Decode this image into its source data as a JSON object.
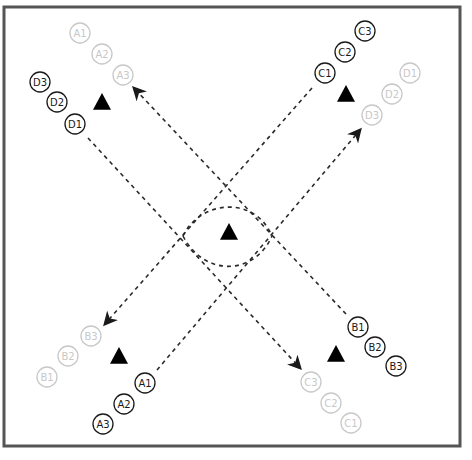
{
  "diagram": {
    "type": "drill-diagram",
    "field": {
      "x": 4,
      "y": 7,
      "width": 456,
      "height": 439,
      "border_color": "#555555",
      "border_width": 3
    },
    "colors": {
      "active": "#1a1a1a",
      "faded": "#c8c8c8",
      "line": "#2a2a2a",
      "cone": "#000000"
    },
    "players": [
      {
        "label": "A1",
        "x": 80,
        "y": 33,
        "style": "faded"
      },
      {
        "label": "A2",
        "x": 102,
        "y": 54,
        "style": "faded"
      },
      {
        "label": "A3",
        "x": 123,
        "y": 75,
        "style": "faded"
      },
      {
        "label": "D3",
        "x": 40,
        "y": 82,
        "style": "active"
      },
      {
        "label": "D2",
        "x": 57,
        "y": 102,
        "style": "active"
      },
      {
        "label": "D1",
        "x": 75,
        "y": 124,
        "style": "active"
      },
      {
        "label": "C3",
        "x": 365,
        "y": 31,
        "style": "active"
      },
      {
        "label": "C2",
        "x": 345,
        "y": 52,
        "style": "active"
      },
      {
        "label": "C1",
        "x": 325,
        "y": 73,
        "style": "active"
      },
      {
        "label": "D1",
        "x": 410,
        "y": 73,
        "style": "faded"
      },
      {
        "label": "D2",
        "x": 392,
        "y": 94,
        "style": "faded"
      },
      {
        "label": "D3",
        "x": 372,
        "y": 115,
        "style": "faded"
      },
      {
        "label": "B3",
        "x": 91,
        "y": 336,
        "style": "faded"
      },
      {
        "label": "B2",
        "x": 68,
        "y": 356,
        "style": "faded"
      },
      {
        "label": "B1",
        "x": 47,
        "y": 377,
        "style": "faded"
      },
      {
        "label": "A1",
        "x": 145,
        "y": 383,
        "style": "active"
      },
      {
        "label": "A2",
        "x": 124,
        "y": 404,
        "style": "active"
      },
      {
        "label": "A3",
        "x": 103,
        "y": 424,
        "style": "active"
      },
      {
        "label": "B1",
        "x": 358,
        "y": 327,
        "style": "active"
      },
      {
        "label": "B2",
        "x": 375,
        "y": 347,
        "style": "active"
      },
      {
        "label": "B3",
        "x": 396,
        "y": 366,
        "style": "active"
      },
      {
        "label": "C3",
        "x": 311,
        "y": 382,
        "style": "faded"
      },
      {
        "label": "C2",
        "x": 331,
        "y": 403,
        "style": "faded"
      },
      {
        "label": "C1",
        "x": 351,
        "y": 423,
        "style": "faded"
      }
    ],
    "cones": [
      {
        "name": "cone-top-left",
        "x": 102,
        "y": 102
      },
      {
        "name": "cone-top-right",
        "x": 346,
        "y": 94
      },
      {
        "name": "cone-center",
        "x": 229,
        "y": 232
      },
      {
        "name": "cone-bottom-left",
        "x": 119,
        "y": 356
      },
      {
        "name": "cone-bottom-right",
        "x": 336,
        "y": 354
      }
    ],
    "runs": [
      {
        "name": "run-a-to-top-left",
        "from": "A1 (bottom)",
        "to": "A3 (top-left)",
        "x1": 157,
        "y1": 370,
        "x2": 360,
        "y2": 130,
        "arrow": "end",
        "note": "bottom-left to top-right then arrow at top-right D3",
        "path": "M157,370 L360,130"
      },
      {
        "name": "run-d-to-bottom-right",
        "from": "D1",
        "to": "C3 (bottom-right)",
        "path": "M88,138 L300,368"
      },
      {
        "name": "run-c-to-bottom-left",
        "from": "C1",
        "to": "B3 (bottom-left)",
        "path": "M312,88 L105,324"
      },
      {
        "name": "run-b-to-top-left",
        "from": "B1",
        "to": "A3 (top-left)",
        "path": "M346,314 L134,88"
      }
    ],
    "center_loop": {
      "upper_arc": "M183,236 C200,200 255,195 272,236",
      "lower_arc": "M183,236 C205,278 255,275 272,236"
    }
  }
}
